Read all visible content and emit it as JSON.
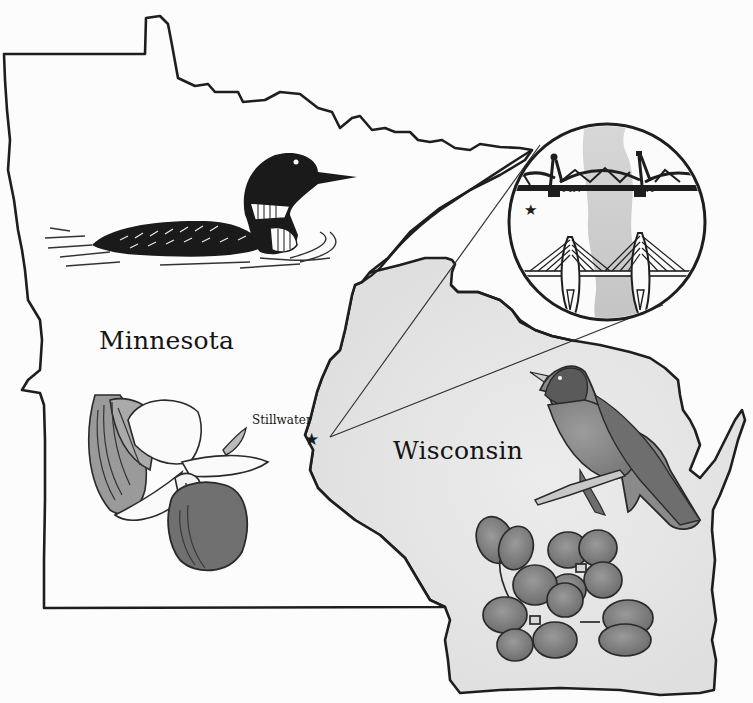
{
  "map": {
    "title": "Minnesota and Wisconsin illustrated map",
    "states": [
      {
        "name": "Minnesota",
        "symbols": [
          "common-loon",
          "lady-slipper-flower"
        ]
      },
      {
        "name": "Wisconsin",
        "symbols": [
          "american-robin",
          "wood-violet"
        ]
      }
    ],
    "cities": [
      {
        "name": "Stillwater",
        "marker": "star"
      }
    ],
    "inset": {
      "description": "Stillwater bridges over the St. Croix River",
      "labels": {
        "left": "MN",
        "right": "WI"
      },
      "marker": "star"
    }
  },
  "labels": {
    "minnesota": "Minnesota",
    "wisconsin": "Wisconsin",
    "stillwater": "Stillwater",
    "inset_mn": "MN",
    "inset_wi": "WI"
  },
  "colors": {
    "background": "#fcfcfc",
    "outline": "#1e1e1e",
    "wisconsin_wash": "#e6e6e6",
    "robin_breast": "#8a8a8a",
    "violet_petal": "#7d7d7d",
    "river_gray": "#c4c4c4"
  }
}
